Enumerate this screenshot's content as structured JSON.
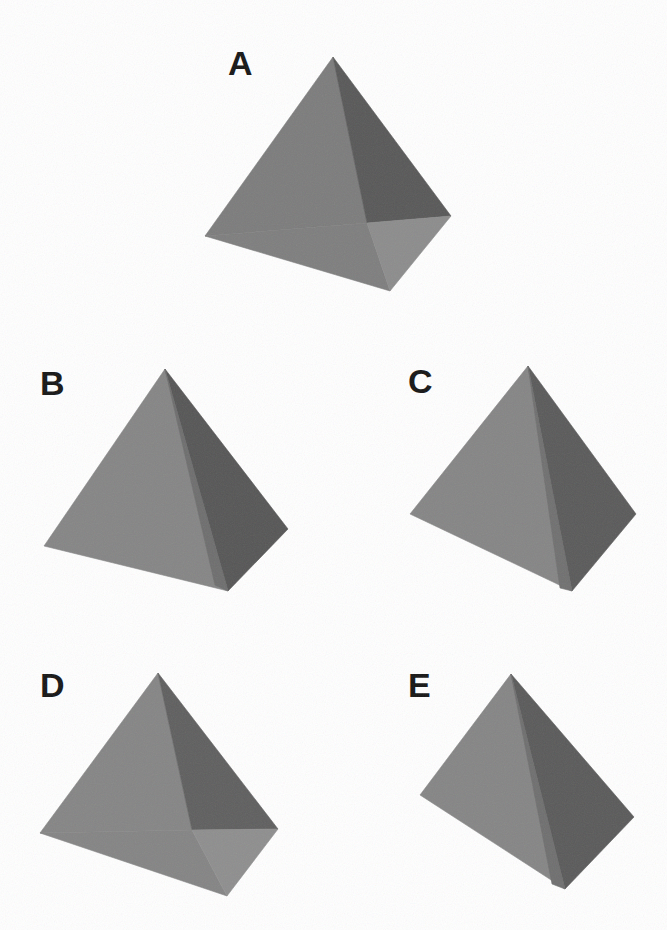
{
  "figure": {
    "background_color": "#ffffff",
    "width": 667,
    "height": 930,
    "label_color": "#151515"
  },
  "palette": {
    "face_light": "#8c8c8c",
    "face_mid": "#7a7a7a",
    "face_mid_dark": "#6f6f6f",
    "face_dark": "#575757",
    "face_darker": "#4e4e4e",
    "base_light": "#8a8a8a",
    "base_mid": "#828282",
    "edge": "#6a6a6a"
  },
  "items": [
    {
      "id": "A",
      "label": "A",
      "label_x": 228,
      "label_y": 46,
      "orientation": "apex up, tilted forward showing underside of square base",
      "faces": [
        {
          "name": "left-face",
          "points": "333,57 205,236 367,223",
          "fill": "#7c7c7c"
        },
        {
          "name": "right-face",
          "points": "333,57 367,223 451,216",
          "fill": "#585858"
        },
        {
          "name": "base-left-tri",
          "points": "205,236 367,223 390,291",
          "fill": "#7e7e7e"
        },
        {
          "name": "base-right-tri",
          "points": "367,223 451,216 390,291",
          "fill": "#8c8c8c"
        }
      ]
    },
    {
      "id": "B",
      "label": "B",
      "label_x": 40,
      "label_y": 366,
      "orientation": "apex up, base hidden, left face light, right face dark",
      "faces": [
        {
          "name": "left-face",
          "points": "165,369 44,546 228,591",
          "fill": "#858585"
        },
        {
          "name": "right-face",
          "points": "165,369 228,591 288,529",
          "fill": "#565656"
        },
        {
          "name": "front-sliver",
          "points": "165,369 215,585 228,591",
          "fill": "#6e6e6e"
        }
      ]
    },
    {
      "id": "C",
      "label": "C",
      "label_x": 408,
      "label_y": 364,
      "orientation": "apex up, base hidden, left face light, right face dark, slightly rotated versus B",
      "faces": [
        {
          "name": "left-face",
          "points": "528,366 410,514 572,591",
          "fill": "#858585"
        },
        {
          "name": "right-face",
          "points": "528,366 572,591 636,514",
          "fill": "#5a5a5a"
        },
        {
          "name": "front-sliver",
          "points": "528,366 560,588 572,591",
          "fill": "#707070"
        }
      ]
    },
    {
      "id": "D",
      "label": "D",
      "label_x": 40,
      "label_y": 668,
      "orientation": "apex up, tilted forward showing underside of square base",
      "faces": [
        {
          "name": "left-face",
          "points": "158,673 40,833 192,830",
          "fill": "#858585"
        },
        {
          "name": "right-face",
          "points": "158,673 192,830 278,829",
          "fill": "#5f5f5f"
        },
        {
          "name": "base-left-tri",
          "points": "40,833 192,830 227,896",
          "fill": "#848484"
        },
        {
          "name": "base-right-tri",
          "points": "192,830 278,829 227,896",
          "fill": "#8e8e8e"
        }
      ]
    },
    {
      "id": "E",
      "label": "E",
      "label_x": 408,
      "label_y": 668,
      "orientation": "apex up, base hidden, left face light, right face dark",
      "faces": [
        {
          "name": "left-face",
          "points": "511,674 420,795 565,889",
          "fill": "#858585"
        },
        {
          "name": "right-face",
          "points": "511,674 565,889 634,817",
          "fill": "#5a5a5a"
        },
        {
          "name": "front-sliver",
          "points": "511,674 552,884 565,889",
          "fill": "#6f6f6f"
        }
      ]
    }
  ]
}
